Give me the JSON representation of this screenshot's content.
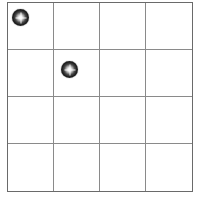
{
  "game": {
    "board": {
      "rows": 4,
      "cols": 4,
      "line_color": "#8a8a8a",
      "border_color": "#6a6a6a",
      "background": "#ffffff"
    },
    "pieces": [
      {
        "type": "sparkle-ball",
        "row": 0,
        "col": 0,
        "color": "#1c1c1c"
      },
      {
        "type": "sparkle-ball",
        "row": 1,
        "col": 1,
        "color": "#1c1c1c"
      }
    ]
  }
}
